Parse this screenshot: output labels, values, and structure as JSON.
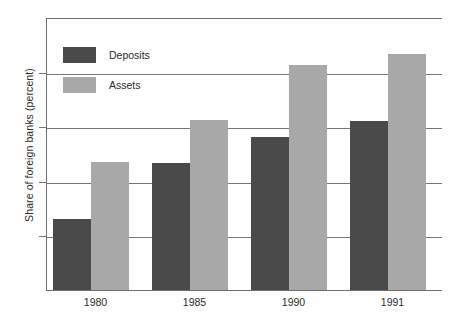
{
  "chart_data": {
    "type": "bar",
    "title": "",
    "xlabel": "",
    "ylabel": "Share of foreign banks (percent)",
    "categories": [
      "1980",
      "1985",
      "1990",
      "1991"
    ],
    "series": [
      {
        "name": "Deposits",
        "color": "#4a4a4a",
        "values": [
          6.5,
          11.6,
          14.0,
          15.5
        ]
      },
      {
        "name": "Assets",
        "color": "#a8a8a8",
        "values": [
          11.7,
          15.6,
          20.6,
          21.6
        ]
      }
    ],
    "ylim": [
      0,
      25
    ],
    "yticks": [
      0,
      5,
      10,
      15,
      20,
      25
    ],
    "ytick_labels": [
      "0",
      "5",
      "10",
      "15",
      "20",
      "25"
    ],
    "grid": true,
    "grid_axis": "y",
    "legend_position": "upper left",
    "legend_entries": [
      "Deposits",
      "Assets"
    ],
    "annotations": []
  }
}
